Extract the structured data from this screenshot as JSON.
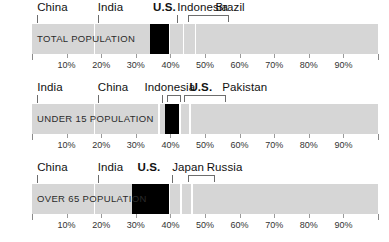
{
  "chart_data": {
    "type": "bar",
    "title": "",
    "subtitle": "",
    "xlabel": "",
    "ylabel": "",
    "xlim": [
      0,
      100
    ],
    "grid": false,
    "legend_position": "above-bar-inline",
    "orientation": "horizontal-stacked",
    "axis": {
      "start_pct": 0,
      "end_pct": 100,
      "tick_labels": [
        "10%",
        "20%",
        "30%",
        "40%",
        "50%",
        "60%",
        "70%",
        "80%",
        "90%"
      ],
      "tick_values": [
        10,
        20,
        30,
        40,
        50,
        60,
        70,
        80,
        90
      ]
    },
    "highlight_color": "#000000",
    "track_color": "#d6d6d6",
    "panels": [
      {
        "caption": "TOTAL POPULATION",
        "segments": [
          {
            "name": "China",
            "start": 0,
            "end": 17.8,
            "highlight": false,
            "label_x_pct": 1.5,
            "marker": "tick",
            "marker_start": 1.5,
            "marker_end": 1.5
          },
          {
            "name": "India",
            "start": 17.8,
            "end": 34.0,
            "highlight": false,
            "label_x_pct": 19.0,
            "marker": "tick",
            "marker_start": 19.0,
            "marker_end": 19.0
          },
          {
            "name": "U.S.",
            "start": 34.0,
            "end": 39.5,
            "highlight": true,
            "label_x_pct": 35.0,
            "marker": "none",
            "marker_start": 35.0,
            "marker_end": 35.0
          },
          {
            "name": "Indonesia",
            "start": 39.5,
            "end": 43.5,
            "highlight": false,
            "label_x_pct": 42.0,
            "marker": "tick",
            "marker_start": 42.0,
            "marker_end": 42.0
          },
          {
            "name": "Brazil",
            "start": 43.5,
            "end": 47.0,
            "highlight": false,
            "label_x_pct": 53.0,
            "marker": "bracket",
            "marker_start": 45.0,
            "marker_end": 57.0
          }
        ]
      },
      {
        "caption": "UNDER 15 POPULATION",
        "segments": [
          {
            "name": "India",
            "start": 0,
            "end": 17.8,
            "highlight": false,
            "label_x_pct": 1.5,
            "marker": "tick",
            "marker_start": 1.5,
            "marker_end": 1.5
          },
          {
            "name": "China",
            "start": 17.8,
            "end": 36.5,
            "highlight": false,
            "label_x_pct": 19.0,
            "marker": "tick",
            "marker_start": 19.0,
            "marker_end": 19.0
          },
          {
            "name": "Indonesia",
            "start": 36.5,
            "end": 38.5,
            "highlight": false,
            "label_x_pct": 32.5,
            "marker": "tick",
            "marker_start": 37.5,
            "marker_end": 37.5
          },
          {
            "name": "U.S.",
            "start": 38.5,
            "end": 42.5,
            "highlight": true,
            "label_x_pct": 45.5,
            "marker": "bracket",
            "marker_start": 39.0,
            "marker_end": 43.0
          },
          {
            "name": "Pakistan",
            "start": 42.5,
            "end": 45.5,
            "highlight": false,
            "label_x_pct": 55.0,
            "marker": "bracket",
            "marker_start": 44.0,
            "marker_end": 56.0
          }
        ]
      },
      {
        "caption": "OVER 65 POPULATION",
        "segments": [
          {
            "name": "China",
            "start": 0,
            "end": 17.8,
            "highlight": false,
            "label_x_pct": 1.5,
            "marker": "tick",
            "marker_start": 1.5,
            "marker_end": 1.5
          },
          {
            "name": "India",
            "start": 17.8,
            "end": 29.0,
            "highlight": false,
            "label_x_pct": 19.0,
            "marker": "tick",
            "marker_start": 19.0,
            "marker_end": 19.0
          },
          {
            "name": "U.S.",
            "start": 29.0,
            "end": 39.5,
            "highlight": true,
            "label_x_pct": 30.5,
            "marker": "none",
            "marker_start": 30.5,
            "marker_end": 30.5
          },
          {
            "name": "Japan",
            "start": 39.5,
            "end": 42.8,
            "highlight": false,
            "label_x_pct": 40.5,
            "marker": "tick",
            "marker_start": 40.5,
            "marker_end": 40.5
          },
          {
            "name": "Russia",
            "start": 42.8,
            "end": 46.0,
            "highlight": false,
            "label_x_pct": 50.5,
            "marker": "bracket",
            "marker_start": 45.0,
            "marker_end": 53.0
          }
        ]
      }
    ]
  }
}
